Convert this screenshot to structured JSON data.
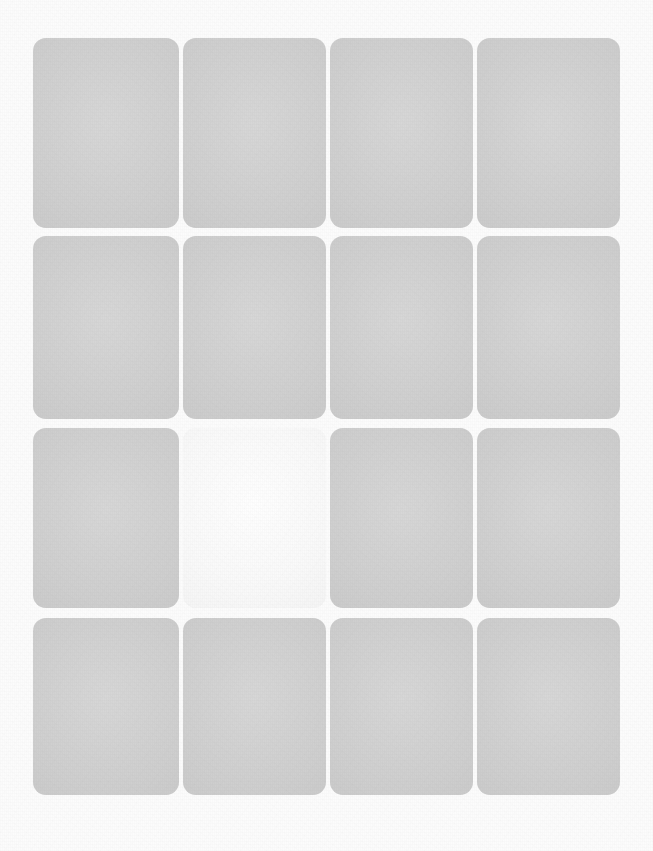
{
  "canvas": {
    "width": 653,
    "height": 851,
    "background_color": "#fcfcfc",
    "texture": "paper-grain-noise"
  },
  "grid": {
    "name": "placeholder-tile-grid",
    "columns": 4,
    "rows": 4,
    "tile_count": 16,
    "tile_fill_color": "#c9c9c9",
    "tile_highlight_color": "#f1f1f1",
    "tile_corner_radius": 13,
    "column_gap": 4,
    "row_gap": 5,
    "content_bounds": {
      "left": 33,
      "top": 38,
      "right": 620,
      "bottom": 795
    },
    "column_edges": [
      33,
      179,
      183,
      326,
      330,
      473,
      477,
      620
    ],
    "row_edges": [
      38,
      228,
      236,
      419,
      428,
      608,
      618,
      795
    ],
    "highlighted_tile": {
      "row": 3,
      "column": 2
    },
    "tiles": [
      {
        "id": "tile-r1c1",
        "row": 1,
        "column": 1,
        "x": 33,
        "y": 38,
        "width": 146,
        "height": 190,
        "state": "default",
        "fill": "#c9c9c9",
        "label": ""
      },
      {
        "id": "tile-r1c2",
        "row": 1,
        "column": 2,
        "x": 183,
        "y": 38,
        "width": 143,
        "height": 190,
        "state": "default",
        "fill": "#c9c9c9",
        "label": ""
      },
      {
        "id": "tile-r1c3",
        "row": 1,
        "column": 3,
        "x": 330,
        "y": 38,
        "width": 143,
        "height": 190,
        "state": "default",
        "fill": "#c9c9c9",
        "label": ""
      },
      {
        "id": "tile-r1c4",
        "row": 1,
        "column": 4,
        "x": 477,
        "y": 38,
        "width": 143,
        "height": 190,
        "state": "default",
        "fill": "#c9c9c9",
        "label": ""
      },
      {
        "id": "tile-r2c1",
        "row": 2,
        "column": 1,
        "x": 33,
        "y": 236,
        "width": 146,
        "height": 183,
        "state": "default",
        "fill": "#c9c9c9",
        "label": ""
      },
      {
        "id": "tile-r2c2",
        "row": 2,
        "column": 2,
        "x": 183,
        "y": 236,
        "width": 143,
        "height": 183,
        "state": "default",
        "fill": "#c9c9c9",
        "label": ""
      },
      {
        "id": "tile-r2c3",
        "row": 2,
        "column": 3,
        "x": 330,
        "y": 236,
        "width": 143,
        "height": 183,
        "state": "default",
        "fill": "#c9c9c9",
        "label": ""
      },
      {
        "id": "tile-r2c4",
        "row": 2,
        "column": 4,
        "x": 477,
        "y": 236,
        "width": 143,
        "height": 183,
        "state": "default",
        "fill": "#c9c9c9",
        "label": ""
      },
      {
        "id": "tile-r3c1",
        "row": 3,
        "column": 1,
        "x": 33,
        "y": 428,
        "width": 146,
        "height": 180,
        "state": "default",
        "fill": "#c9c9c9",
        "label": ""
      },
      {
        "id": "tile-r3c2",
        "row": 3,
        "column": 2,
        "x": 183,
        "y": 428,
        "width": 143,
        "height": 180,
        "state": "highlighted",
        "fill": "#f1f1f1",
        "label": ""
      },
      {
        "id": "tile-r3c3",
        "row": 3,
        "column": 3,
        "x": 330,
        "y": 428,
        "width": 143,
        "height": 180,
        "state": "default",
        "fill": "#c9c9c9",
        "label": ""
      },
      {
        "id": "tile-r3c4",
        "row": 3,
        "column": 4,
        "x": 477,
        "y": 428,
        "width": 143,
        "height": 180,
        "state": "default",
        "fill": "#c9c9c9",
        "label": ""
      },
      {
        "id": "tile-r4c1",
        "row": 4,
        "column": 1,
        "x": 33,
        "y": 618,
        "width": 146,
        "height": 177,
        "state": "default",
        "fill": "#c9c9c9",
        "label": ""
      },
      {
        "id": "tile-r4c2",
        "row": 4,
        "column": 2,
        "x": 183,
        "y": 618,
        "width": 143,
        "height": 177,
        "state": "default",
        "fill": "#c9c9c9",
        "label": ""
      },
      {
        "id": "tile-r4c3",
        "row": 4,
        "column": 3,
        "x": 330,
        "y": 618,
        "width": 143,
        "height": 177,
        "state": "default",
        "fill": "#c9c9c9",
        "label": ""
      },
      {
        "id": "tile-r4c4",
        "row": 4,
        "column": 4,
        "x": 477,
        "y": 618,
        "width": 143,
        "height": 177,
        "state": "default",
        "fill": "#c9c9c9",
        "label": ""
      }
    ]
  }
}
